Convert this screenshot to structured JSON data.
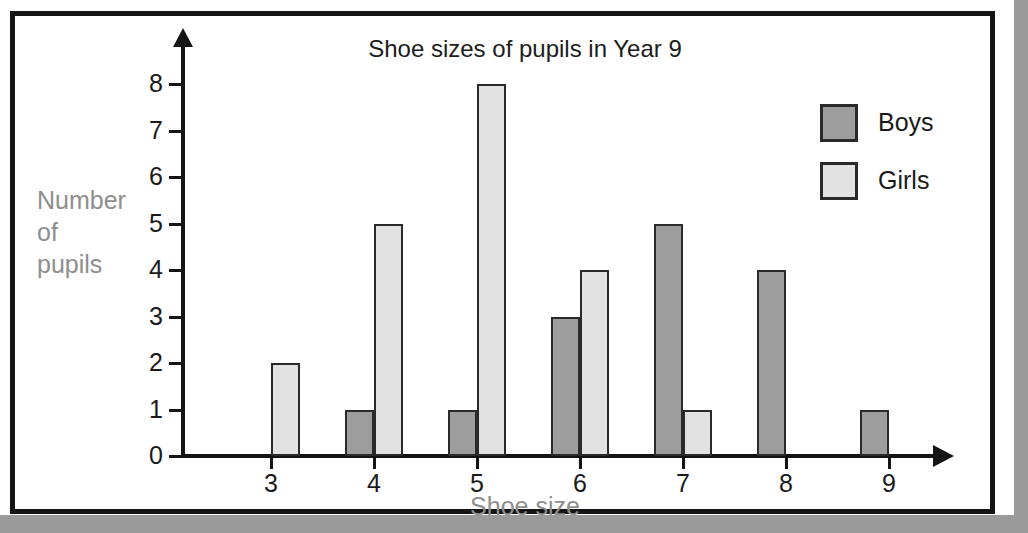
{
  "chart_data": {
    "type": "bar",
    "title": "Shoe sizes of pupils in Year 9",
    "xlabel": "Shoe size",
    "ylabel": "Number of pupils",
    "ylabel_lines": [
      "Number",
      "of",
      "pupils"
    ],
    "categories": [
      "3",
      "4",
      "5",
      "6",
      "7",
      "8",
      "9"
    ],
    "series": [
      {
        "name": "Boys",
        "color": "#9d9d9d",
        "values": [
          0,
          1,
          1,
          3,
          5,
          4,
          1
        ]
      },
      {
        "name": "Girls",
        "color": "#e2e2e2",
        "values": [
          2,
          5,
          8,
          4,
          1,
          0,
          0
        ]
      }
    ],
    "ylim": [
      0,
      8
    ],
    "ytick_labels": [
      "0",
      "1",
      "2",
      "3",
      "4",
      "5",
      "6",
      "7",
      "8"
    ],
    "ytick_values": [
      0,
      1,
      2,
      3,
      4,
      5,
      6,
      7,
      8
    ],
    "grid": false,
    "legend_position": "top-right",
    "legend_entries": [
      "Boys",
      "Girls"
    ],
    "axis_style": "arrow-tipped",
    "label_color": "#8e8e8e",
    "tick_color": "#1a1a1a",
    "axis_color": "#141414",
    "bar_border_color": "#2a2a2a",
    "frame_color": "#151515",
    "background_color": "#ffffff"
  }
}
